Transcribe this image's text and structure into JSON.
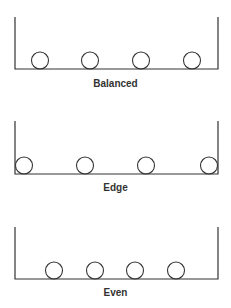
{
  "diagram": {
    "stroke_color": "#333333",
    "background": "#ffffff",
    "panels": [
      {
        "label": "Balanced",
        "container": {
          "left": 15,
          "right": 218,
          "top": 17,
          "bottom": 69
        },
        "ball_radius": 8.5,
        "ball_centers_x": [
          40,
          90,
          141,
          192
        ],
        "label_y": 78
      },
      {
        "label": "Edge",
        "container": {
          "left": 15,
          "right": 218,
          "top": 121,
          "bottom": 174
        },
        "ball_radius": 8.5,
        "ball_centers_x": [
          24,
          85,
          146,
          209
        ],
        "label_y": 182
      },
      {
        "label": "Even",
        "container": {
          "left": 15,
          "right": 218,
          "top": 227,
          "bottom": 279
        },
        "ball_radius": 8.5,
        "ball_centers_x": [
          54,
          95,
          135,
          176
        ],
        "label_y": 287
      }
    ]
  }
}
